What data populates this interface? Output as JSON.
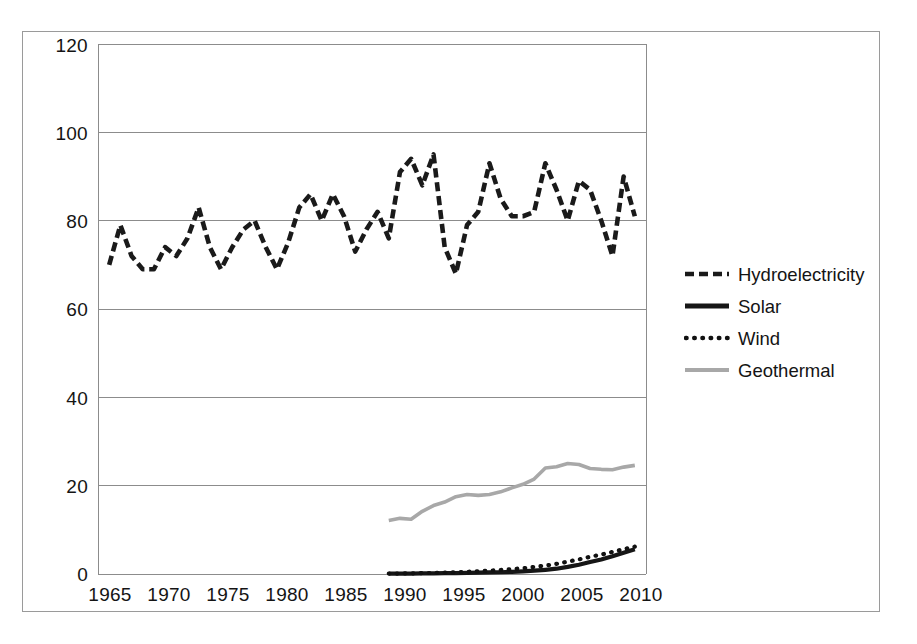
{
  "chart_data": {
    "type": "line",
    "title": "",
    "subtitle": "",
    "xlabel": "",
    "ylabel": "",
    "xlim": [
      1964,
      2013
    ],
    "ylim": [
      0,
      120
    ],
    "ytick_step": 20,
    "xtick_step": 5,
    "grid": "horizontal",
    "legend_position": "right",
    "yticks": [
      "0",
      "20",
      "40",
      "60",
      "80",
      "100",
      "120"
    ],
    "xticks": [
      "1965",
      "1970",
      "1975",
      "1980",
      "1985",
      "1990",
      "1995",
      "2000",
      "2005",
      "2010"
    ],
    "x": [
      1965,
      1966,
      1967,
      1968,
      1969,
      1970,
      1971,
      1972,
      1973,
      1974,
      1975,
      1976,
      1977,
      1978,
      1979,
      1980,
      1981,
      1982,
      1983,
      1984,
      1985,
      1986,
      1987,
      1988,
      1989,
      1990,
      1991,
      1992,
      1993,
      1994,
      1995,
      1996,
      1997,
      1998,
      1999,
      2000,
      2001,
      2002,
      2003,
      2004,
      2005,
      2006,
      2007,
      2008,
      2009,
      2010,
      2011,
      2012
    ],
    "series": [
      {
        "name": "Hydroelectricity",
        "style": "dashed",
        "color": "#1a1a1a",
        "width": 4.6,
        "values": [
          70,
          79,
          72,
          69,
          69,
          74,
          72,
          76,
          83,
          74,
          69,
          74,
          78,
          80,
          74,
          69,
          75,
          83,
          86,
          80,
          86,
          81,
          73,
          78,
          82,
          76,
          91,
          94,
          88,
          95,
          74,
          68,
          79,
          82,
          93,
          85,
          81,
          81,
          82,
          93,
          87,
          80,
          89,
          87,
          80,
          72,
          90,
          81
        ]
      },
      {
        "name": "Solar",
        "style": "solid",
        "color": "#161616",
        "width": 4.2,
        "values": [
          null,
          null,
          null,
          null,
          null,
          null,
          null,
          null,
          null,
          null,
          null,
          null,
          null,
          null,
          null,
          null,
          null,
          null,
          null,
          null,
          null,
          null,
          null,
          null,
          null,
          0.1,
          0.1,
          0.1,
          0.15,
          0.15,
          0.2,
          0.2,
          0.25,
          0.3,
          0.35,
          0.4,
          0.5,
          0.6,
          0.75,
          0.95,
          1.2,
          1.6,
          2.1,
          2.7,
          3.3,
          4.0,
          4.8,
          5.6
        ]
      },
      {
        "name": "Wind",
        "style": "dotted",
        "color": "#111111",
        "width": 4.2,
        "values": [
          null,
          null,
          null,
          null,
          null,
          null,
          null,
          null,
          null,
          null,
          null,
          null,
          null,
          null,
          null,
          null,
          null,
          null,
          null,
          null,
          null,
          null,
          null,
          null,
          null,
          0.1,
          0.1,
          0.15,
          0.2,
          0.25,
          0.3,
          0.4,
          0.5,
          0.6,
          0.75,
          0.9,
          1.1,
          1.3,
          1.6,
          1.9,
          2.3,
          2.8,
          3.3,
          3.9,
          4.4,
          5.0,
          5.6,
          6.2
        ]
      },
      {
        "name": "Geothermal",
        "style": "solid",
        "color": "#a8a8a8",
        "width": 3.6,
        "values": [
          null,
          null,
          null,
          null,
          null,
          null,
          null,
          null,
          null,
          null,
          null,
          null,
          null,
          null,
          null,
          null,
          null,
          null,
          null,
          null,
          null,
          null,
          null,
          null,
          null,
          12.1,
          12.6,
          12.4,
          14.2,
          15.5,
          16.3,
          17.5,
          18.0,
          17.8,
          18.0,
          18.6,
          19.5,
          20.3,
          21.5,
          24.0,
          24.3,
          25.0,
          24.8,
          23.9,
          23.7,
          23.6,
          24.2,
          24.6
        ]
      }
    ]
  },
  "legend": {
    "items": [
      {
        "label": "Hydroelectricity",
        "swatch": "dashed-line-swatch"
      },
      {
        "label": "Solar",
        "swatch": "solid-line-swatch"
      },
      {
        "label": "Wind",
        "swatch": "dotted-line-swatch"
      },
      {
        "label": "Geothermal",
        "swatch": "gray-line-swatch"
      }
    ]
  },
  "axes": {
    "y_labels": [
      "120",
      "100",
      "80",
      "60",
      "40",
      "20",
      "0"
    ],
    "x_labels": [
      "1965",
      "1970",
      "1975",
      "1980",
      "1985",
      "1990",
      "1995",
      "2000",
      "2005",
      "2010"
    ]
  },
  "colors": {
    "frame": "#9a9a9a",
    "gridline": "#8c8c8c",
    "plot_border": "#8c8c8c",
    "hydro": "#1a1a1a",
    "solar": "#161616",
    "wind": "#111111",
    "geothermal": "#a8a8a8",
    "background": "#ffffff",
    "text": "#141414"
  }
}
